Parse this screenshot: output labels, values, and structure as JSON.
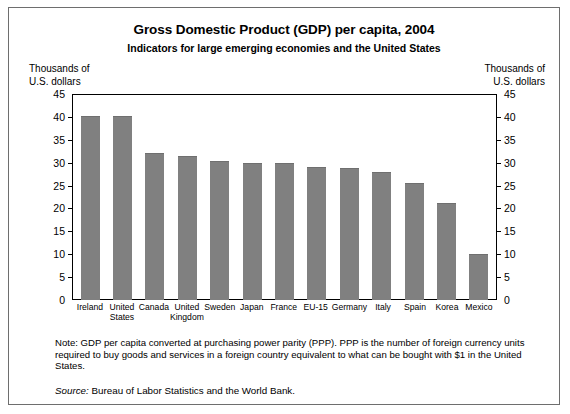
{
  "figure": {
    "title": "Gross Domestic Product (GDP) per capita, 2004",
    "subtitle": "Indicators for large emerging economies and the United States",
    "unit_caption_left": "Thousands of\nU.S. dollars",
    "unit_caption_right": "Thousands of\nU.S. dollars",
    "note": "Note:  GDP per capita converted at purchasing power parity (PPP). PPP is the number of foreign currency units required to buy goods and services in a foreign country equivalent to what can be bought with $1 in the United States.",
    "source_word": "Source:",
    "source_text": " Bureau of Labor Statistics and the World Bank.",
    "bar_color": "#808080"
  },
  "chart_data": {
    "type": "bar",
    "title": "Gross Domestic Product (GDP) per capita, 2004",
    "subtitle": "Indicators for large emerging economies and the United States",
    "xlabel": "",
    "ylabel": "Thousands of U.S. dollars",
    "ylim": [
      0,
      45
    ],
    "yticks": [
      0,
      5,
      10,
      15,
      20,
      25,
      30,
      35,
      40,
      45
    ],
    "grid": false,
    "legend": "none",
    "categories": [
      "Ireland",
      "United States",
      "Canada",
      "United Kingdom",
      "Sweden",
      "Japan",
      "France",
      "EU-15",
      "Germany",
      "Italy",
      "Spain",
      "Korea",
      "Mexico"
    ],
    "values": [
      40.1,
      40.1,
      32.1,
      31.5,
      30.3,
      30.0,
      30.0,
      29.0,
      28.9,
      28.0,
      25.5,
      21.1,
      10.0
    ]
  }
}
